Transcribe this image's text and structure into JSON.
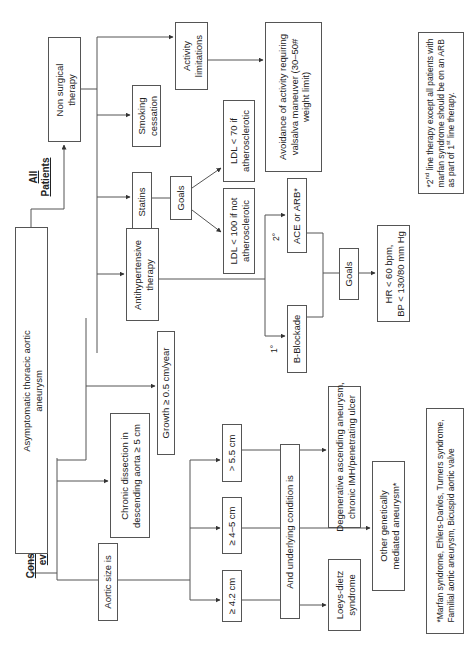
{
  "diagram": {
    "orientation": "rotated 90 degrees counter-clockwise",
    "root": {
      "label_line1": "Asymptomatic thoracic aortic",
      "label_line2": "aneurysm"
    },
    "section_labels": {
      "all_patients_line1": "All",
      "all_patients_line2": "Patients",
      "surgical_line1": "Consider surgical",
      "surgical_line2": "evaluation if"
    },
    "non_surgical": {
      "label_line1": "Non surgical",
      "label_line2": "therapy",
      "smoking_line1": "Smoking",
      "smoking_line2": "cessation",
      "activity_line1": "Activity",
      "activity_line2": "limitations",
      "avoidance_line1": "Avoidance of activity requiring",
      "avoidance_line2": "valsalva maneuver (30–50#",
      "avoidance_line3": "weight limit)",
      "statins": "Statins",
      "statins_goals": "Goals",
      "ldl70_line1": "LDL < 70 if",
      "ldl70_line2": "atherosclerotic",
      "ldl100_line1": "LDL < 100 if not",
      "ldl100_line2": "atherosclerotic",
      "antihypertensive_line1": "Antihypertensive",
      "antihypertensive_line2": "therapy",
      "first_line_marker": "1°",
      "second_line_marker": "2°",
      "beta_blockade": "B-Blockade",
      "ace_arb": "ACE or ARB*",
      "bp_goals": "Goals",
      "hr_goal": "HR < 60 bpm,",
      "bp_goal": "BP < 130/80 mm Hg"
    },
    "surgical": {
      "chronic_dissection_line1": "Chronic dissection in",
      "chronic_dissection_line2": "descending aorta ≥ 5 cm",
      "growth": "Growth ≥ 0.5 cm/year",
      "aortic_size": "Aortic size is",
      "size_gt_5_5": "> 5.5 cm",
      "size_4_5": "≥ 4–5 cm",
      "size_4_2": "≥ 4.2 cm",
      "underlying_condition": "And underlying condition is",
      "degenerative_line1": "Degenerative ascending aneurysm,",
      "degenerative_line2": "chronic IMH/penetrating ulcer",
      "other_genetic_line1": "Other genetically",
      "other_genetic_line2": "mediated aneurysm*",
      "loeys_line1": "Loeys-dietz",
      "loeys_line2": "syndrome"
    },
    "footnotes": {
      "second_line_prefix": "*2",
      "second_line_sup": "nd",
      "second_line_rest": " line therapy except all patients with",
      "second_line_line2": "marfan syndrome should be on an ARB",
      "second_line_line3_pre": "as part of 1",
      "second_line_line3_sup": "st",
      "second_line_line3_post": " line therapy.",
      "genetic_line1": "*Marfan syndrome, Ehlers-Danlos, Turners syndrome,",
      "genetic_line2": "Familial aortic aneurysm, Bicuspid aortic valve"
    },
    "colors": {
      "line": "#555555",
      "text": "#222222",
      "background": "#ffffff"
    }
  }
}
